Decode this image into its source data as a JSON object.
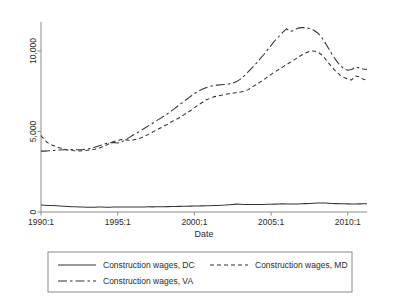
{
  "chart_data": {
    "type": "line",
    "title": "",
    "xlabel": "Date",
    "ylabel": "",
    "xlim": [
      1990.0,
      2011.25
    ],
    "ylim": [
      0,
      11800
    ],
    "grid": false,
    "legend_position": "bottom",
    "xtick_labels": [
      "1990:1",
      "1995:1",
      "2000:1",
      "2005:1",
      "2010:1"
    ],
    "xtick_values": [
      1990.0,
      1995.0,
      2000.0,
      2005.0,
      2010.0
    ],
    "ytick_labels": [
      "0",
      "5,000",
      "10,000"
    ],
    "ytick_values": [
      0,
      5000,
      10000
    ],
    "x": [
      1990.0,
      1990.25,
      1990.5,
      1990.75,
      1991.0,
      1991.25,
      1991.5,
      1991.75,
      1992.0,
      1992.25,
      1992.5,
      1992.75,
      1993.0,
      1993.25,
      1993.5,
      1993.75,
      1994.0,
      1994.25,
      1994.5,
      1994.75,
      1995.0,
      1995.25,
      1995.5,
      1995.75,
      1996.0,
      1996.25,
      1996.5,
      1996.75,
      1997.0,
      1997.25,
      1997.5,
      1997.75,
      1998.0,
      1998.25,
      1998.5,
      1998.75,
      1999.0,
      1999.25,
      1999.5,
      1999.75,
      2000.0,
      2000.25,
      2000.5,
      2000.75,
      2001.0,
      2001.25,
      2001.5,
      2001.75,
      2002.0,
      2002.25,
      2002.5,
      2002.75,
      2003.0,
      2003.25,
      2003.5,
      2003.75,
      2004.0,
      2004.25,
      2004.5,
      2004.75,
      2005.0,
      2005.25,
      2005.5,
      2005.75,
      2006.0,
      2006.25,
      2006.5,
      2006.75,
      2007.0,
      2007.25,
      2007.5,
      2007.75,
      2008.0,
      2008.25,
      2008.5,
      2008.75,
      2009.0,
      2009.25,
      2009.5,
      2009.75,
      2010.0,
      2010.25,
      2010.5,
      2010.75,
      2011.0,
      2011.25
    ],
    "series": [
      {
        "name": "Construction wages, DC",
        "style": "solid",
        "values": [
          430,
          420,
          410,
          400,
          390,
          370,
          355,
          345,
          330,
          320,
          310,
          305,
          300,
          300,
          300,
          305,
          305,
          300,
          300,
          305,
          310,
          310,
          305,
          305,
          305,
          310,
          315,
          315,
          320,
          320,
          325,
          330,
          330,
          335,
          340,
          345,
          350,
          355,
          360,
          365,
          370,
          375,
          380,
          385,
          390,
          400,
          410,
          420,
          430,
          450,
          470,
          490,
          480,
          470,
          465,
          460,
          460,
          465,
          470,
          475,
          480,
          490,
          500,
          505,
          500,
          495,
          495,
          500,
          510,
          520,
          530,
          545,
          560,
          565,
          560,
          545,
          530,
          520,
          515,
          510,
          505,
          500,
          500,
          505,
          510,
          515
        ]
      },
      {
        "name": "Construction wages, MD",
        "style": "dashed",
        "values": [
          4750,
          4450,
          4250,
          4150,
          4050,
          3980,
          3900,
          3850,
          3820,
          3800,
          3790,
          3800,
          3830,
          3870,
          3900,
          3950,
          4050,
          4150,
          4280,
          4380,
          4450,
          4500,
          4480,
          4450,
          4470,
          4520,
          4600,
          4700,
          4820,
          4950,
          5080,
          5200,
          5320,
          5450,
          5600,
          5720,
          5850,
          6000,
          6150,
          6300,
          6480,
          6650,
          6800,
          6950,
          7050,
          7150,
          7200,
          7250,
          7300,
          7350,
          7380,
          7420,
          7450,
          7500,
          7600,
          7750,
          7900,
          8050,
          8200,
          8380,
          8550,
          8700,
          8850,
          9000,
          9150,
          9300,
          9450,
          9600,
          9750,
          9880,
          9980,
          10000,
          9950,
          9800,
          9550,
          9250,
          8950,
          8700,
          8500,
          8350,
          8250,
          8200,
          8450,
          8400,
          8250,
          8180
        ]
      },
      {
        "name": "Construction wages, VA",
        "style": "longdash",
        "values": [
          3780,
          3780,
          3800,
          3820,
          3840,
          3850,
          3860,
          3870,
          3880,
          3870,
          3870,
          3880,
          3900,
          3950,
          4020,
          4100,
          4180,
          4250,
          4300,
          4320,
          4280,
          4350,
          4480,
          4620,
          4780,
          4900,
          5050,
          5200,
          5350,
          5500,
          5650,
          5800,
          5950,
          6100,
          6280,
          6450,
          6650,
          6820,
          7000,
          7180,
          7350,
          7500,
          7620,
          7720,
          7800,
          7850,
          7880,
          7900,
          7920,
          7950,
          8000,
          8100,
          8250,
          8450,
          8700,
          8950,
          9200,
          9480,
          9750,
          10050,
          10350,
          10650,
          10900,
          11150,
          11380,
          11200,
          11300,
          11420,
          11450,
          11450,
          11400,
          11300,
          11150,
          10900,
          10550,
          10150,
          9750,
          9400,
          9100,
          8900,
          8800,
          8850,
          9000,
          8950,
          8880,
          8850
        ]
      }
    ]
  },
  "legend": {
    "entries": [
      {
        "label": "Construction wages, DC",
        "style": "solid"
      },
      {
        "label": "Construction wages, MD",
        "style": "dashed"
      },
      {
        "label": "Construction wages, VA",
        "style": "longdash"
      }
    ]
  }
}
